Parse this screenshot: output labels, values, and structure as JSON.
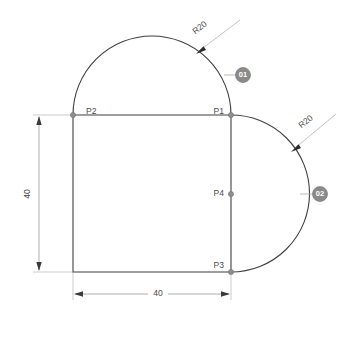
{
  "drawing": {
    "title": "Technical sketch - rounded profile with two R20 arcs",
    "background_color": "#ffffff",
    "line_color": "#3f3f3f",
    "dimension_color": "#9a9a9a",
    "callout_fill": "#8a8a8a",
    "callout_text_color": "#ffffff"
  },
  "points": [
    {
      "id": "P1",
      "label": "P1",
      "x": 231,
      "y": 115,
      "label_x": 210,
      "label_y": 112
    },
    {
      "id": "P2",
      "label": "P2",
      "x": 73,
      "y": 115,
      "label_x": 86,
      "label_y": 112
    },
    {
      "id": "P3",
      "label": "P3",
      "x": 231,
      "y": 272,
      "label_x": 210,
      "label_y": 269
    },
    {
      "id": "P4",
      "label": "P4",
      "x": 231,
      "y": 194,
      "label_x": 210,
      "label_y": 197
    }
  ],
  "dimensions": [
    {
      "id": "vertical-40",
      "label": "40",
      "value": 40,
      "orientation": "vertical",
      "text_x": 28,
      "text_y": 194
    },
    {
      "id": "horizontal-40",
      "label": "40",
      "value": 40,
      "orientation": "horizontal",
      "text_x": 158,
      "text_y": 303
    }
  ],
  "radius_labels": [
    {
      "id": "radius-top",
      "label": "R20",
      "value": 20,
      "text_x": 200,
      "text_y": 28,
      "rotation": -45
    },
    {
      "id": "radius-right",
      "label": "R20",
      "value": 20,
      "text_x": 305,
      "text_y": 122,
      "rotation": -45
    }
  ],
  "callouts": [
    {
      "id": "callout-01",
      "label": "01",
      "cx": 243,
      "cy": 75
    },
    {
      "id": "callout-02",
      "label": "02",
      "cx": 320,
      "cy": 194
    }
  ],
  "geometry": {
    "top_arc": {
      "type": "semicircle",
      "from": "P2",
      "to": "P1",
      "center_x": 152,
      "center_y": 115,
      "radius": 79,
      "radius_label": "R20"
    },
    "right_arc": {
      "type": "semicircle",
      "from": "P1",
      "to": "P3",
      "center_x": 231,
      "center_y": 194,
      "radius": 78,
      "radius_label": "R20"
    },
    "top_edge": {
      "from": "P2",
      "to": "P1",
      "length_label": ""
    },
    "left_edge": {
      "from": "P2",
      "to": "bottom-left",
      "length_label": "40"
    },
    "bottom_edge": {
      "from": "bottom-left",
      "to": "P3",
      "length_label": "40"
    },
    "right_edge": {
      "from": "P1",
      "to": "P3",
      "length_label": ""
    }
  }
}
